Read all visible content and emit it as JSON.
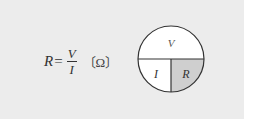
{
  "formula": {
    "lhs": "R",
    "equals": "=",
    "numerator": "V",
    "denominator": "I",
    "unit": "〔Ω〕"
  },
  "diagram": {
    "top_label": "V",
    "bottom_left_label": "I",
    "bottom_right_label": "R",
    "highlighted_section": "R",
    "colors": {
      "background_panel": "#ececec",
      "circle_fill": "#ffffff",
      "highlight_fill": "#cfcfcf",
      "stroke": "#333333"
    }
  }
}
